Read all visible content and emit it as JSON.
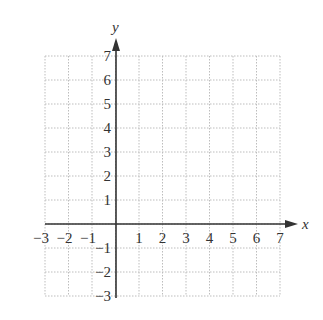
{
  "chart_data": {
    "type": "scatter",
    "title": "",
    "xlabel": "x",
    "ylabel": "y",
    "xlim": [
      -3,
      7
    ],
    "ylim": [
      -3,
      7
    ],
    "grid": true,
    "grid_style": "dotted",
    "x_ticks": [
      "-3",
      "-2",
      "-1",
      "1",
      "2",
      "3",
      "4",
      "5",
      "6",
      "7"
    ],
    "y_ticks": [
      "7",
      "6",
      "5",
      "4",
      "3",
      "2",
      "1",
      "-1",
      "-2",
      "-3"
    ],
    "series": [],
    "colors": {
      "axis": "#333333",
      "grid": "#bdbdbd",
      "text": "#333333"
    }
  },
  "axes": {
    "x_label": "x",
    "y_label": "y"
  },
  "ticks": {
    "x": [
      {
        "label": "−3",
        "value": -3
      },
      {
        "label": "−2",
        "value": -2
      },
      {
        "label": "−1",
        "value": -1
      },
      {
        "label": "1",
        "value": 1
      },
      {
        "label": "2",
        "value": 2
      },
      {
        "label": "3",
        "value": 3
      },
      {
        "label": "4",
        "value": 4
      },
      {
        "label": "5",
        "value": 5
      },
      {
        "label": "6",
        "value": 6
      },
      {
        "label": "7",
        "value": 7
      }
    ],
    "y": [
      {
        "label": "7",
        "value": 7
      },
      {
        "label": "6",
        "value": 6
      },
      {
        "label": "5",
        "value": 5
      },
      {
        "label": "4",
        "value": 4
      },
      {
        "label": "3",
        "value": 3
      },
      {
        "label": "2",
        "value": 2
      },
      {
        "label": "1",
        "value": 1
      },
      {
        "label": "−1",
        "value": -1
      },
      {
        "label": "−2",
        "value": -2
      },
      {
        "label": "−3",
        "value": -3
      }
    ]
  }
}
